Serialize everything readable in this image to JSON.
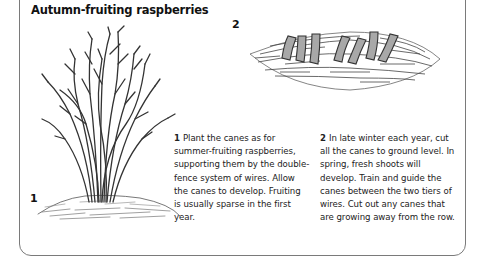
{
  "title": "Autumn-fruiting raspberries",
  "steps": [
    {
      "number": "1",
      "text": "Plant the canes as for summer-fruiting raspberries, supporting them by the double-fence system of wires. Allow the canes to develop. Fruiting is usually sparse in the first year.",
      "illustration": "raspberry-canes-clump-icon"
    },
    {
      "number": "2",
      "text": "In late winter each year, cut all the canes to ground level. In spring, fresh shoots will develop. Train and guide the canes between the two tiers of wires. Cut out any canes that are growing away from the row.",
      "illustration": "cut-cane-stumps-icon"
    }
  ],
  "colors": {
    "border": "#7a7a7a",
    "text": "#222222",
    "stump_fill": "#a8a8a8"
  }
}
